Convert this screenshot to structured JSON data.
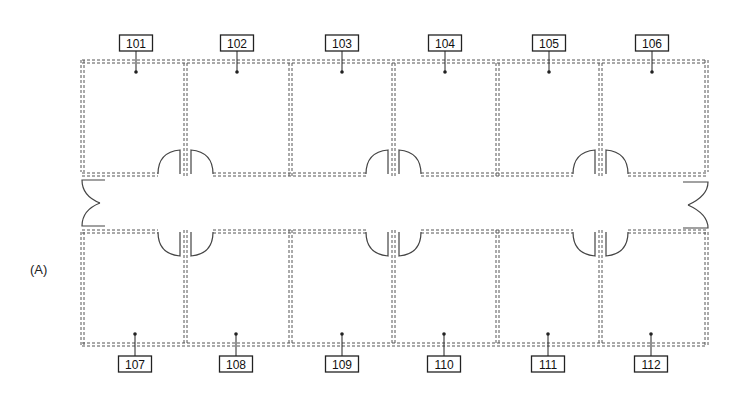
{
  "panel_label": "(A)",
  "rooms_top": [
    {
      "id": "101",
      "label": "101",
      "x": 136
    },
    {
      "id": "102",
      "label": "102",
      "x": 237
    },
    {
      "id": "103",
      "label": "103",
      "x": 342
    },
    {
      "id": "104",
      "label": "104",
      "x": 445
    },
    {
      "id": "105",
      "label": "105",
      "x": 549
    },
    {
      "id": "106",
      "label": "106",
      "x": 652
    }
  ],
  "rooms_bottom": [
    {
      "id": "107",
      "label": "107",
      "x": 135
    },
    {
      "id": "108",
      "label": "108",
      "x": 236
    },
    {
      "id": "109",
      "label": "109",
      "x": 342
    },
    {
      "id": "110",
      "label": "110",
      "x": 444
    },
    {
      "id": "111",
      "label": "111",
      "x": 548
    },
    {
      "id": "112",
      "label": "112",
      "x": 651
    }
  ],
  "colors": {
    "wall": "#555555",
    "label_border": "#222222",
    "background": "#ffffff"
  }
}
